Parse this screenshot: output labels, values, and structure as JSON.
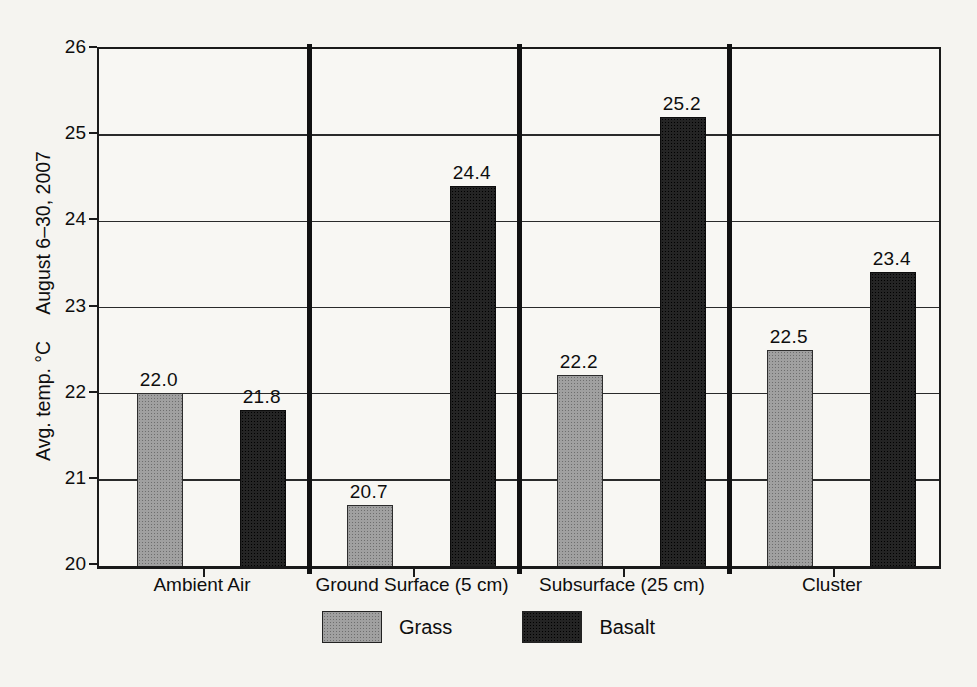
{
  "chart_data": {
    "type": "bar",
    "title": "",
    "ylabel_part1": "Avg. temp. °C",
    "ylabel_part2": "August 6–30, 2007",
    "ylim": [
      20,
      26
    ],
    "ytick_step": 1,
    "yticks": [
      20,
      21,
      22,
      23,
      24,
      25,
      26
    ],
    "grid": "horizontal",
    "value_labels": true,
    "value_label_decimals": 1,
    "categories": [
      "Ambient Air",
      "Ground Surface (5 cm)",
      "Subsurface (25 cm)",
      "Cluster"
    ],
    "series": [
      {
        "name": "Grass",
        "color": "#a0a0a0",
        "values": [
          22.0,
          20.7,
          22.2,
          22.5
        ]
      },
      {
        "name": "Basalt",
        "color": "#242424",
        "values": [
          21.8,
          24.4,
          25.2,
          23.4
        ]
      }
    ],
    "group_dividers": true,
    "legend_position": "bottom"
  },
  "legend": {
    "items": [
      {
        "label": "Grass",
        "swatch": "grass-swatch",
        "color": "#a0a0a0"
      },
      {
        "label": "Basalt",
        "swatch": "basalt-swatch",
        "color": "#242424"
      }
    ]
  },
  "colors": {
    "background": "#f5f4f0",
    "axis_line": "#1a1a1a",
    "text": "#0e0e0e"
  }
}
